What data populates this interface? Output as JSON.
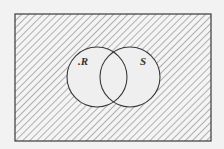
{
  "diagram": {
    "type": "venn",
    "universe": {
      "shaded": true
    },
    "sets": [
      {
        "id": "R",
        "label": "R",
        "label_prefix": ".",
        "shaded": false
      },
      {
        "id": "S",
        "label": "S",
        "label_prefix": "",
        "shaded": false
      }
    ],
    "shaded_region": "complement of (R ∪ S)",
    "colors": {
      "background": "#f2f2f2",
      "line": "#3a3a3a",
      "hatch": "#8a8a8a",
      "circle_fill": "#efefef"
    }
  }
}
